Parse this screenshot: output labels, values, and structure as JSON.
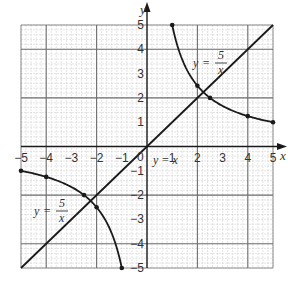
{
  "chart_data": {
    "type": "line",
    "title": "",
    "xlabel": "x",
    "ylabel": "y",
    "xlim": [
      -5,
      5
    ],
    "ylim": [
      -5,
      5
    ],
    "grid": true,
    "x_ticks": [
      -5,
      -4,
      -3,
      -2,
      -1,
      0,
      1,
      2,
      3,
      4,
      5
    ],
    "y_ticks": [
      -5,
      -4,
      -3,
      -2,
      -1,
      1,
      2,
      3,
      4,
      5
    ],
    "series": [
      {
        "name": "y = 5/x (positive branch)",
        "label": "y = 5/x",
        "function": "5/x",
        "domain": [
          1,
          5
        ],
        "points": [
          [
            1,
            5
          ],
          [
            2,
            2.5
          ],
          [
            2.5,
            2
          ],
          [
            4,
            1.25
          ],
          [
            5,
            1
          ]
        ],
        "markers": true
      },
      {
        "name": "y = 5/x (negative branch)",
        "label": "y = 5/x",
        "function": "5/x",
        "domain": [
          -5,
          -1
        ],
        "points": [
          [
            -5,
            -1
          ],
          [
            -4,
            -1.25
          ],
          [
            -2.5,
            -2
          ],
          [
            -2,
            -2.5
          ],
          [
            -1,
            -5
          ]
        ],
        "markers": true
      },
      {
        "name": "y = x",
        "label": "y = x",
        "function": "x",
        "domain": [
          -5,
          5
        ],
        "points": [
          [
            -5,
            -5
          ],
          [
            5,
            5
          ]
        ],
        "markers": false
      }
    ],
    "annotations": [
      {
        "text": "y = 5/x",
        "x": 2.2,
        "y": 3.6
      },
      {
        "text": "y = 5/x",
        "x": -3.4,
        "y": -2.4
      },
      {
        "text": "y = x",
        "x": 0.8,
        "y": -0.5
      }
    ],
    "intersections": [
      [
        2.236,
        2.236
      ],
      [
        -2.236,
        -2.236
      ]
    ]
  },
  "labels": {
    "x_axis": "x",
    "y_axis": "y",
    "origin": "0",
    "curve_upper": {
      "y": "y",
      "eq": "=",
      "num": "5",
      "den": "x"
    },
    "curve_lower": {
      "y": "y",
      "eq": "=",
      "num": "5",
      "den": "x"
    },
    "line": "y = x"
  },
  "colors": {
    "curve": "#1a1a1a",
    "grid_minor": "#c8c8c8",
    "grid_major": "#6e6e6e",
    "axis": "#1a1a1a",
    "text": "#333333"
  }
}
